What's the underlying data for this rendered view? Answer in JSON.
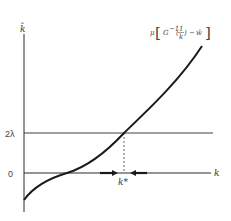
{
  "diagram": {
    "y_axis_label": "k̂",
    "x_axis_label": "k",
    "curve_label": {
      "mu": "μ",
      "G": "G",
      "inv": "−1",
      "frac_num": "1",
      "frac_den": "k",
      "minus": "−",
      "w": "w̄"
    },
    "ticks": {
      "two_lambda": "2λ",
      "zero": "0"
    },
    "equilibrium_label": "k*",
    "colors": {
      "line": "#2a2a2a",
      "curve": "#1a1a1a",
      "guide": "#555555"
    }
  }
}
